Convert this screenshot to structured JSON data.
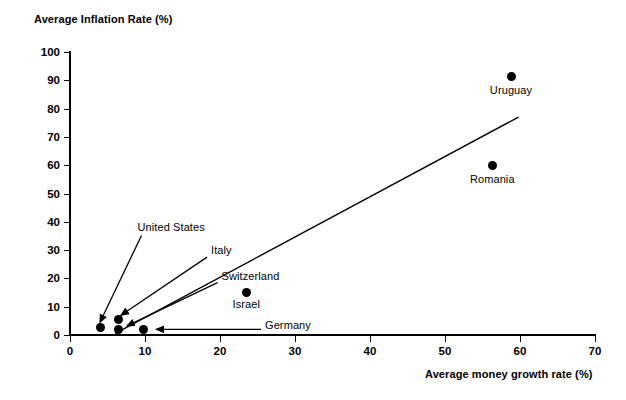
{
  "chart_data": {
    "type": "scatter",
    "title": "",
    "xlabel": "Average money growth rate (%)",
    "ylabel": "Average Inflation Rate (%)",
    "xlim": [
      0,
      70
    ],
    "ylim": [
      0,
      100
    ],
    "xticks": [
      0,
      10,
      20,
      30,
      40,
      50,
      60,
      70
    ],
    "yticks": [
      0,
      10,
      20,
      30,
      40,
      50,
      60,
      70,
      80,
      90,
      100
    ],
    "grid": false,
    "legend": "none",
    "points": [
      {
        "label": "United States",
        "x": 4.0,
        "y": 2.5
      },
      {
        "label": "Switzerland",
        "x": 6.4,
        "y": 2.0
      },
      {
        "label": "Italy",
        "x": 6.4,
        "y": 5.5
      },
      {
        "label": "Germany",
        "x": 9.8,
        "y": 2.0
      },
      {
        "label": "Israel",
        "x": 23.5,
        "y": 15.0
      },
      {
        "label": "Romania",
        "x": 56.3,
        "y": 60.0
      },
      {
        "label": "Uruguay",
        "x": 58.8,
        "y": 91.5
      }
    ],
    "trend_line": {
      "type": "line",
      "x": [
        6.0,
        59.8
      ],
      "y": [
        0.5,
        77.0
      ]
    },
    "annotations": [
      {
        "text": "United States",
        "label_x": 9.0,
        "label_y": 38.0,
        "arrow_to_x": 4.0,
        "arrow_to_y": 4.5,
        "arrow_style": "vertical-down"
      },
      {
        "text": "Italy",
        "label_x": 18.8,
        "label_y": 30.0,
        "arrow_to_x": 6.8,
        "arrow_to_y": 7.0,
        "arrow_style": "diagonal-down-left"
      },
      {
        "text": "Switzerland",
        "label_x": 20.2,
        "label_y": 21.0,
        "arrow_to_x": 7.6,
        "arrow_to_y": 3.2,
        "arrow_style": "diagonal-down-left"
      },
      {
        "text": "Germany",
        "label_x": 26.0,
        "label_y": 3.6,
        "arrow_to_x": 11.5,
        "arrow_to_y": 2.0,
        "arrow_style": "horizontal-left"
      }
    ],
    "point_labels": [
      {
        "text": "Israel",
        "x": 23.5,
        "y": 11.0,
        "align": "center"
      },
      {
        "text": "Romania",
        "x": 56.3,
        "y": 55.0,
        "align": "center"
      },
      {
        "text": "Uruguay",
        "x": 58.8,
        "y": 86.5,
        "align": "center"
      }
    ]
  },
  "colors": {
    "axis": "#000000",
    "marker": "#000000",
    "trend": "#000000",
    "background": "#ffffff"
  }
}
